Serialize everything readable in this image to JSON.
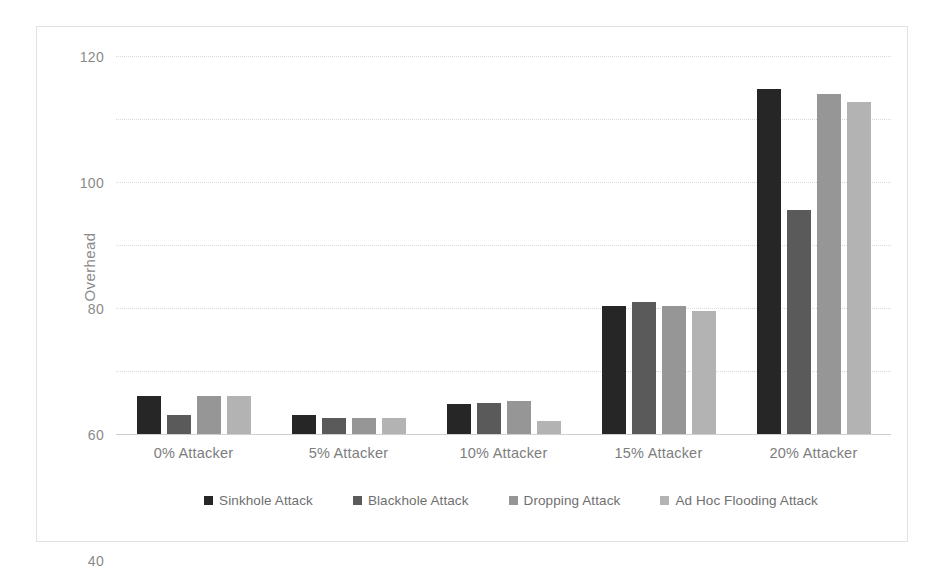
{
  "chart_data": {
    "type": "bar",
    "title": "",
    "xlabel": "",
    "ylabel": "Overhead",
    "ylim": [
      0,
      120
    ],
    "yticks": [
      0,
      20,
      40,
      60,
      80,
      100,
      120
    ],
    "grid": true,
    "legend_position": "bottom",
    "categories": [
      "0% Attacker",
      "5% Attacker",
      "10% Attacker",
      "15% Attacker",
      "20% Attacker"
    ],
    "series": [
      {
        "name": "Sinkhole Attack",
        "color": "#262626",
        "values": [
          12,
          6,
          9.5,
          40.5,
          109.5
        ]
      },
      {
        "name": "Blackhole Attack",
        "color": "#5a5a5a",
        "values": [
          6,
          5,
          10,
          42,
          71
        ]
      },
      {
        "name": "Dropping Attack",
        "color": "#969696",
        "values": [
          12,
          5,
          10.5,
          40.5,
          108
        ]
      },
      {
        "name": "Ad Hoc Flooding Attack",
        "color": "#b3b3b3",
        "values": [
          12,
          5,
          4,
          39,
          105.5
        ]
      }
    ]
  }
}
